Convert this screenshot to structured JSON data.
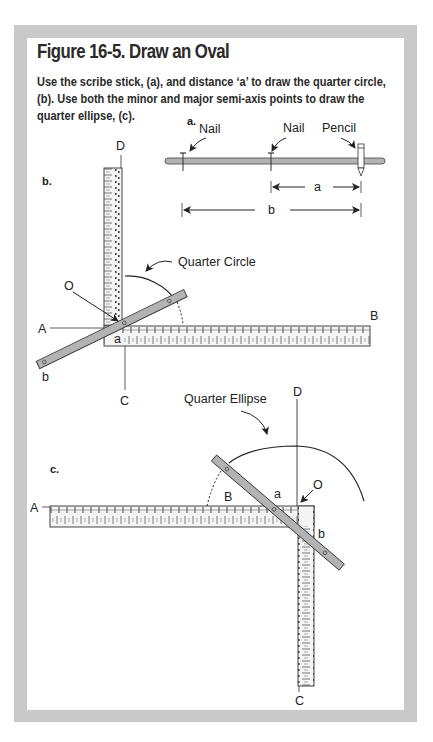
{
  "figure": {
    "title": "Figure 16-5. Draw an Oval",
    "caption": "Use the scribe stick, (a), and distance ‘a’ to draw the quarter circle, (b). Use both the minor and major semi-axis points to draw the quarter ellipse, (c).",
    "frame_color": "#c9c9c9",
    "stick_color": "#b3b3b3"
  },
  "panel_a": {
    "label": "a.",
    "callouts": [
      "Nail",
      "Nail",
      "Pencil"
    ],
    "dimension_a": "a",
    "dimension_b": "b"
  },
  "panel_b": {
    "label": "b.",
    "callout": "Quarter Circle",
    "points": {
      "D": "D",
      "O": "O",
      "A": "A",
      "B": "B",
      "C": "C",
      "a": "a",
      "b": "b"
    }
  },
  "panel_c": {
    "label": "c.",
    "callout": "Quarter Ellipse",
    "points": {
      "D": "D",
      "O": "O",
      "A": "A",
      "B": "B",
      "C": "C",
      "a": "a",
      "b": "b"
    }
  }
}
